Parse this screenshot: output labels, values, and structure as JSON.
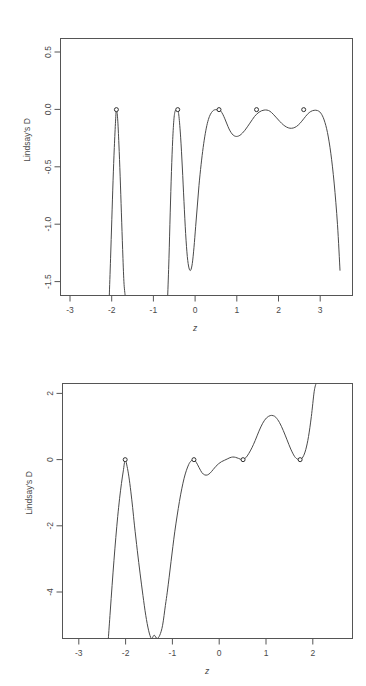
{
  "figure": {
    "background": "#ffffff",
    "line_color": "#4a4a4a",
    "axis_color": "#555555",
    "marker_fill": "#ffffff",
    "marker_stroke": "#2e2e2e",
    "panel_count": 2
  },
  "chart_data": [
    {
      "type": "line",
      "title": "",
      "xlabel": "z",
      "ylabel": "Lindsay's D",
      "xlim": [
        -3.5,
        3.5
      ],
      "ylim": [
        -1.62,
        0.62
      ],
      "xticks": [
        -3,
        -2,
        -1,
        0,
        1,
        2,
        3
      ],
      "xticklabels": [
        "-3",
        "-2",
        "-1",
        "0",
        "1",
        "2",
        "3"
      ],
      "yticks": [
        0.5,
        0.0,
        -0.5,
        -1.0,
        -1.5
      ],
      "yticklabels": [
        "0.5",
        "0.0",
        "-0.5",
        "-1.0",
        "-1.5"
      ],
      "grid": false,
      "legend": "none",
      "marker_shape": "open-circle",
      "markers": [
        {
          "x": -2.16,
          "y": 0.0
        },
        {
          "x": -0.69,
          "y": 0.0
        },
        {
          "x": 0.3,
          "y": 0.0
        },
        {
          "x": 1.2,
          "y": 0.0
        },
        {
          "x": 2.33,
          "y": 0.0
        }
      ],
      "x": [
        -2.33,
        -2.3,
        -2.27,
        -2.24,
        -2.21,
        -2.18,
        -2.16,
        -2.13,
        -2.1,
        -2.07,
        -2.04,
        -2.01,
        -1.98,
        -1.95,
        -0.93,
        -0.9,
        -0.87,
        -0.84,
        -0.81,
        -0.78,
        -0.75,
        -0.72,
        -0.69,
        -0.66,
        -0.62,
        -0.58,
        -0.54,
        -0.5,
        -0.46,
        -0.42,
        -0.38,
        -0.34,
        -0.3,
        -0.26,
        -0.22,
        -0.18,
        -0.13,
        -0.08,
        -0.03,
        0.02,
        0.07,
        0.12,
        0.17,
        0.22,
        0.27,
        0.3,
        0.34,
        0.39,
        0.44,
        0.49,
        0.54,
        0.59,
        0.64,
        0.69,
        0.74,
        0.8,
        0.86,
        0.92,
        0.98,
        1.04,
        1.1,
        1.15,
        1.2,
        1.26,
        1.32,
        1.38,
        1.45,
        1.52,
        1.6,
        1.68,
        1.76,
        1.84,
        1.92,
        2.0,
        2.08,
        2.16,
        2.24,
        2.33,
        2.42,
        2.5,
        2.58,
        2.66,
        2.74,
        2.82,
        2.9,
        2.98,
        3.06,
        3.14,
        3.2
      ],
      "y": [
        -1.62,
        -1.3,
        -0.96,
        -0.62,
        -0.33,
        -0.1,
        0.0,
        -0.08,
        -0.3,
        -0.58,
        -0.9,
        -1.22,
        -1.5,
        -1.62,
        -1.62,
        -1.3,
        -0.9,
        -0.54,
        -0.26,
        -0.08,
        -0.01,
        -0.01,
        0.0,
        -0.06,
        -0.24,
        -0.5,
        -0.8,
        -1.08,
        -1.28,
        -1.38,
        -1.4,
        -1.34,
        -1.2,
        -1.02,
        -0.84,
        -0.66,
        -0.48,
        -0.33,
        -0.21,
        -0.12,
        -0.06,
        -0.025,
        -0.006,
        0.0,
        -0.002,
        0.0,
        -0.012,
        -0.04,
        -0.08,
        -0.125,
        -0.168,
        -0.2,
        -0.222,
        -0.232,
        -0.233,
        -0.224,
        -0.205,
        -0.18,
        -0.15,
        -0.118,
        -0.086,
        -0.06,
        -0.04,
        -0.022,
        -0.01,
        -0.004,
        -0.004,
        -0.014,
        -0.04,
        -0.072,
        -0.104,
        -0.132,
        -0.152,
        -0.162,
        -0.16,
        -0.146,
        -0.12,
        -0.08,
        -0.04,
        -0.016,
        -0.006,
        -0.008,
        -0.03,
        -0.09,
        -0.2,
        -0.38,
        -0.64,
        -1.0,
        -1.4,
        -1.62
      ]
    },
    {
      "type": "line",
      "title": "",
      "xlabel": "z",
      "ylabel": "Lindsay's D",
      "xlim": [
        -3.5,
        2.7
      ],
      "ylim": [
        -5.4,
        2.3
      ],
      "xticks": [
        -3,
        -2,
        -1,
        0,
        1,
        2
      ],
      "xticklabels": [
        "-3",
        "-2",
        "-1",
        "0",
        "1",
        "2"
      ],
      "yticks": [
        2,
        0,
        -2,
        -4
      ],
      "yticklabels": [
        "2",
        "0",
        "-2",
        "-4"
      ],
      "grid": false,
      "legend": "none",
      "marker_shape": "open-circle",
      "markers": [
        {
          "x": -2.16,
          "y": 0.0
        },
        {
          "x": -0.69,
          "y": 0.0
        },
        {
          "x": 0.36,
          "y": 0.0
        },
        {
          "x": 1.58,
          "y": 0.0
        }
      ],
      "x": [
        -2.52,
        -2.48,
        -2.44,
        -2.4,
        -2.36,
        -2.32,
        -2.28,
        -2.24,
        -2.2,
        -2.16,
        -2.12,
        -2.08,
        -2.04,
        -2.0,
        -1.96,
        -1.9,
        -1.84,
        -1.78,
        -1.72,
        -1.66,
        -1.6,
        -1.54,
        -1.48,
        -1.42,
        -1.36,
        -1.3,
        -1.26,
        -1.22,
        -1.18,
        -1.14,
        -1.1,
        -1.05,
        -1.0,
        -0.95,
        -0.9,
        -0.85,
        -0.8,
        -0.76,
        -0.72,
        -0.69,
        -0.64,
        -0.58,
        -0.52,
        -0.46,
        -0.4,
        -0.34,
        -0.28,
        -0.22,
        -0.16,
        -0.1,
        -0.04,
        0.02,
        0.08,
        0.14,
        0.2,
        0.26,
        0.31,
        0.36,
        0.42,
        0.48,
        0.55,
        0.62,
        0.7,
        0.78,
        0.86,
        0.94,
        1.0,
        1.06,
        1.14,
        1.22,
        1.3,
        1.38,
        1.46,
        1.52,
        1.58,
        1.64,
        1.7,
        1.76,
        1.82,
        1.88,
        1.92
      ],
      "y": [
        -5.4,
        -4.6,
        -3.8,
        -3.05,
        -2.35,
        -1.72,
        -1.18,
        -0.72,
        -0.34,
        0.0,
        -0.2,
        -0.52,
        -0.95,
        -1.45,
        -2.0,
        -2.75,
        -3.45,
        -4.1,
        -4.7,
        -5.15,
        -5.4,
        -5.3,
        -5.4,
        -5.3,
        -5.0,
        -4.4,
        -4.0,
        -3.55,
        -3.08,
        -2.62,
        -2.18,
        -1.7,
        -1.26,
        -0.88,
        -0.56,
        -0.32,
        -0.14,
        -0.05,
        -0.01,
        0.0,
        -0.08,
        -0.24,
        -0.39,
        -0.46,
        -0.46,
        -0.4,
        -0.3,
        -0.2,
        -0.12,
        -0.06,
        -0.02,
        0.02,
        0.06,
        0.08,
        0.07,
        0.04,
        0.01,
        0.0,
        0.06,
        0.18,
        0.36,
        0.58,
        0.86,
        1.1,
        1.26,
        1.33,
        1.33,
        1.28,
        1.12,
        0.88,
        0.6,
        0.32,
        0.1,
        0.02,
        0.0,
        0.08,
        0.3,
        0.7,
        1.3,
        2.05,
        2.3
      ]
    }
  ]
}
